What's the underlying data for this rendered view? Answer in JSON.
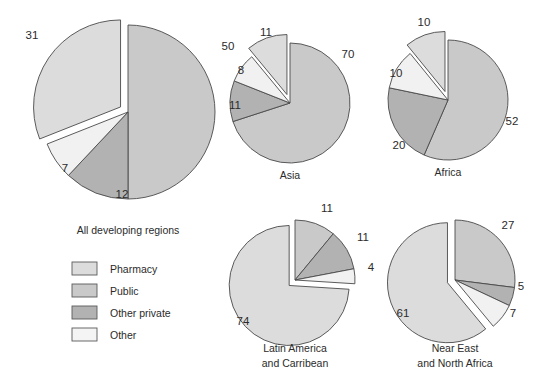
{
  "figure": {
    "background": "#ffffff",
    "width": 541,
    "height": 381
  },
  "legend": {
    "items": [
      {
        "label": "Pharmacy",
        "color": "#dcdcdc"
      },
      {
        "label": "Public",
        "color": "#c9c9c9"
      },
      {
        "label": "Other private",
        "color": "#b2b2b2"
      },
      {
        "label": "Other",
        "color": "#f4f4f4"
      }
    ]
  },
  "chart_data": [
    {
      "type": "pie",
      "title": "All developing regions",
      "categories": [
        "Public",
        "Other private",
        "Other",
        "Pharmacy"
      ],
      "values": [
        50,
        12,
        7,
        31
      ],
      "labels": [
        "50",
        "12",
        "7",
        "31"
      ],
      "colors": [
        "#c9c9c9",
        "#b2b2b2",
        "#f1f1f1",
        "#dcdcdc"
      ],
      "exploded": [
        false,
        false,
        false,
        true
      ],
      "legend": "right"
    },
    {
      "type": "pie",
      "title": "Asia",
      "categories": [
        "Public",
        "Other private",
        "Other",
        "Pharmacy"
      ],
      "values": [
        70,
        11,
        8,
        11
      ],
      "labels": [
        "70",
        "11",
        "8",
        "11"
      ],
      "colors": [
        "#c9c9c9",
        "#b2b2b2",
        "#f1f1f1",
        "#dcdcdc"
      ],
      "exploded": [
        false,
        false,
        false,
        true
      ],
      "legend": "none"
    },
    {
      "type": "pie",
      "title": "Africa",
      "categories": [
        "Public",
        "Other private",
        "Other",
        "Pharmacy"
      ],
      "values": [
        52,
        20,
        10,
        10
      ],
      "labels": [
        "52",
        "20",
        "10",
        "10"
      ],
      "colors": [
        "#c9c9c9",
        "#b2b2b2",
        "#f1f1f1",
        "#dcdcdc"
      ],
      "exploded": [
        false,
        false,
        false,
        true
      ],
      "legend": "none"
    },
    {
      "type": "pie",
      "title": "Latin America and Carribean",
      "title_lines": [
        "Latin America",
        "and Carribean"
      ],
      "categories": [
        "Public",
        "Other private",
        "Other",
        "Pharmacy"
      ],
      "values": [
        11,
        11,
        4,
        74
      ],
      "labels": [
        "11",
        "11",
        "4",
        "74"
      ],
      "colors": [
        "#c9c9c9",
        "#b2b2b2",
        "#f1f1f1",
        "#dcdcdc"
      ],
      "exploded": [
        false,
        false,
        false,
        true
      ],
      "legend": "none"
    },
    {
      "type": "pie",
      "title": "Near East and North Africa",
      "title_lines": [
        "Near East",
        "and North Africa"
      ],
      "categories": [
        "Public",
        "Other private",
        "Other",
        "Pharmacy"
      ],
      "values": [
        27,
        5,
        7,
        61
      ],
      "labels": [
        "27",
        "5",
        "7",
        "61"
      ],
      "colors": [
        "#c9c9c9",
        "#b2b2b2",
        "#f1f1f1",
        "#dcdcdc"
      ],
      "exploded": [
        false,
        false,
        false,
        true
      ],
      "legend": "none"
    }
  ],
  "geometry": {
    "pies": [
      {
        "cx": 128,
        "cy": 112,
        "r": 87,
        "explode": 9,
        "start_deg": 0
      },
      {
        "cx": 290,
        "cy": 103,
        "r": 60,
        "explode": 9,
        "start_deg": 0
      },
      {
        "cx": 448,
        "cy": 100,
        "r": 60,
        "explode": 9,
        "start_deg": 0
      },
      {
        "cx": 295,
        "cy": 280,
        "r": 60,
        "explode": 8,
        "start_deg": 0
      },
      {
        "cx": 455,
        "cy": 280,
        "r": 60,
        "explode": 8,
        "start_deg": 0
      }
    ],
    "titles": [
      {
        "x": 128,
        "y": 234
      },
      {
        "x": 290,
        "y": 179
      },
      {
        "x": 448,
        "y": 176
      },
      {
        "x": 295,
        "y": 352
      },
      {
        "x": 455,
        "y": 352
      }
    ],
    "value_labels": [
      [
        {
          "x": 228,
          "y": 47
        },
        {
          "x": 122,
          "y": 195
        },
        {
          "x": 65,
          "y": 169
        },
        {
          "x": 32,
          "y": 36
        }
      ],
      [
        {
          "x": 348,
          "y": 55
        },
        {
          "x": 235,
          "y": 106
        },
        {
          "x": 241,
          "y": 71
        },
        {
          "x": 266,
          "y": 33
        }
      ],
      [
        {
          "x": 512,
          "y": 122
        },
        {
          "x": 399,
          "y": 146
        },
        {
          "x": 396,
          "y": 74
        },
        {
          "x": 424,
          "y": 23
        }
      ],
      [
        {
          "x": 327,
          "y": 209
        },
        {
          "x": 363,
          "y": 238
        },
        {
          "x": 371,
          "y": 268
        },
        {
          "x": 243,
          "y": 322
        }
      ],
      [
        {
          "x": 508,
          "y": 226
        },
        {
          "x": 521,
          "y": 287
        },
        {
          "x": 513,
          "y": 314
        },
        {
          "x": 403,
          "y": 314
        }
      ]
    ],
    "legend": {
      "x": 72,
      "y": 262,
      "sw_w": 25,
      "sw_h": 13,
      "row_h": 22,
      "text_dx": 38
    }
  }
}
